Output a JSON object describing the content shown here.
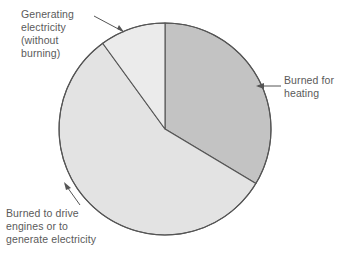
{
  "figure": {
    "background_color": "#ffffff",
    "stroke_color": "#555555"
  },
  "chart_data": {
    "type": "pie",
    "title": "",
    "subtitle": "",
    "xlabel": "",
    "ylabel": "",
    "legend_position": "none",
    "grid": false,
    "labels_placement": "callout-annotations",
    "center": {
      "x": 165,
      "y": 129
    },
    "radius": 106,
    "start_angle_deg": 0,
    "direction": "clockwise",
    "categories": [
      "Burned for heating",
      "Burned to drive engines or to generate electricity",
      "Generating electricity (without burning)"
    ],
    "values": [
      34,
      56,
      10
    ],
    "units": "percent",
    "slices": [
      {
        "name": "Burned for heating",
        "value": 34,
        "start_angle_deg": 0,
        "end_angle_deg": 121,
        "color": "#c3c3c3"
      },
      {
        "name": "Burned to drive engines or to generate electricity",
        "value": 56,
        "start_angle_deg": 121,
        "end_angle_deg": 324,
        "color": "#e3e3e3"
      },
      {
        "name": "Generating electricity (without burning)",
        "value": 10,
        "start_angle_deg": 324,
        "end_angle_deg": 360,
        "color": "#ebebeb"
      }
    ]
  },
  "annotations": {
    "generating": {
      "text": "Generating\nelectricity\n(without\nburning)",
      "leader_from": {
        "x": 94,
        "y": 16
      },
      "leader_to": {
        "x": 124,
        "y": 32
      }
    },
    "heating": {
      "text": "Burned for\nheating",
      "leader_from": {
        "x": 281,
        "y": 86
      },
      "leader_to": {
        "x": 258,
        "y": 86
      }
    },
    "engines": {
      "text": "Burned to drive\nengines or to\ngenerate electricity",
      "leader_from": {
        "x": 80,
        "y": 205
      },
      "leader_to": {
        "x": 65,
        "y": 184
      }
    }
  }
}
